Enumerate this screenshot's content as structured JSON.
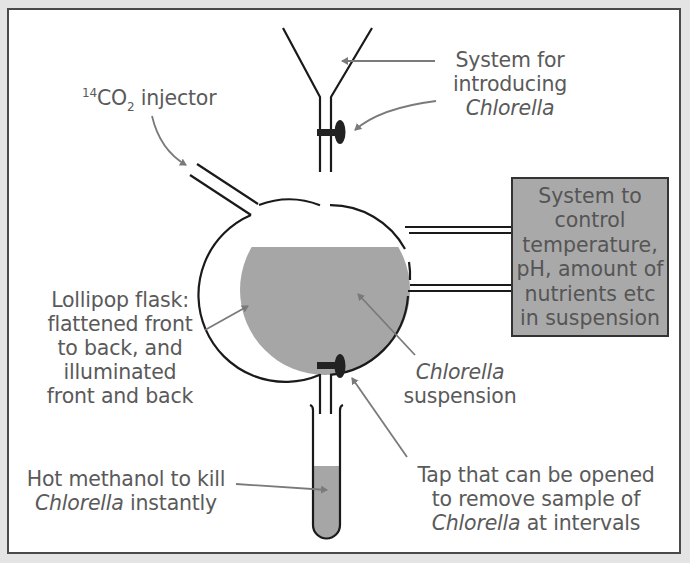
{
  "diagram": {
    "colors": {
      "background": "#e4e4e4",
      "frame_border": "#4a4a4a",
      "line": "#1a1a1a",
      "suspension_fill": "#a6a6a6",
      "control_box_fill": "#a9a9a9",
      "label_text": "#5a5a5a",
      "arrow": "#7a7a7a"
    },
    "labels": {
      "injector": {
        "sup": "14",
        "main": "CO",
        "sub": "2",
        "rest": " injector"
      },
      "introducing": {
        "line1": "System for",
        "line2": "introducing",
        "line3_italic": "Chlorella"
      },
      "control_box": {
        "lines": [
          "System to",
          "control",
          "temperature,",
          "pH, amount of",
          "nutrients etc",
          "in suspension"
        ]
      },
      "flask": {
        "lines": [
          "Lollipop flask:",
          "flattened front",
          "to back, and",
          "illuminated",
          "front and back"
        ]
      },
      "suspension": {
        "line1_italic": "Chlorella",
        "line2": "suspension"
      },
      "methanol": {
        "line1": "Hot methanol to kill",
        "line2_italic": "Chlorella",
        "line2_rest": " instantly"
      },
      "tap": {
        "line1": "Tap that can be opened",
        "line2": "to remove sample of",
        "line3_italic": "Chlorella",
        "line3_rest": " at intervals"
      }
    },
    "components": [
      "funnel",
      "top-tap",
      "co2-injector-tube",
      "lollipop-flask",
      "chlorella-suspension",
      "control-pipes",
      "control-system-box",
      "bottom-tap",
      "test-tube",
      "hot-methanol"
    ]
  }
}
